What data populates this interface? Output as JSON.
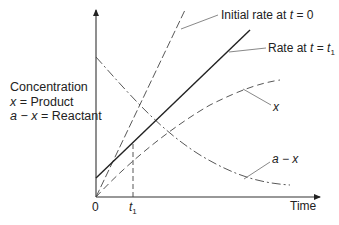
{
  "diagram": {
    "y_axis_label": {
      "line1": "Concentration",
      "line2_var": "x",
      "line2_rest": " = Product",
      "line3_var": "a − x",
      "line3_rest": " = Reactant"
    },
    "x_axis_label": "Time",
    "origin_label": "0",
    "t1_label": {
      "var": "t",
      "sub": "1"
    },
    "annotations": {
      "initial_rate": {
        "prefix": "Initial rate at ",
        "var": "t",
        "rest": " = 0"
      },
      "rate_t1": {
        "prefix": "Rate at ",
        "var": "t",
        "eq": " = ",
        "var2": "t",
        "sub": "1"
      },
      "product_curve": "x",
      "reactant_curve": "a − x"
    },
    "curves": [
      {
        "name": "x",
        "meaning": "Product concentration",
        "style": "dashed",
        "shape": "rising, saturating"
      },
      {
        "name": "a − x",
        "meaning": "Reactant concentration",
        "style": "dash-dot",
        "shape": "decaying"
      },
      {
        "name": "Initial rate at t = 0",
        "style": "dashed",
        "shape": "tangent at origin"
      },
      {
        "name": "Rate at t = t1",
        "style": "solid",
        "shape": "tangent at t1"
      }
    ],
    "colors": {
      "ink": "#222222",
      "background": "#ffffff"
    }
  }
}
